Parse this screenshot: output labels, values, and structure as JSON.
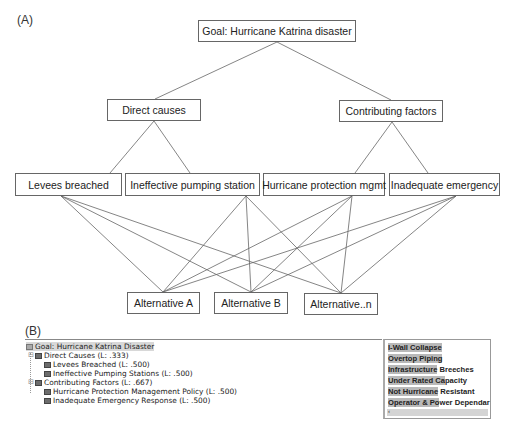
{
  "section_a": {
    "label": "(A)",
    "goal": "Goal: Hurricane Katrina disaster",
    "criteria": [
      "Direct causes",
      "Contributing factors"
    ],
    "subcriteria": [
      "Levees breached",
      "Ineffective pumping station",
      "Hurricane protection mgmt",
      "Inadequate emergency"
    ],
    "alternatives": [
      "Alternative A",
      "Alternative B",
      "Alternative..n"
    ]
  },
  "section_b": {
    "label": "(B)",
    "tree": {
      "goal": "Goal: Hurricane Katrina Disaster",
      "items": [
        {
          "label": "Direct Causes (L: .333)",
          "level": 1,
          "expander": "⊟"
        },
        {
          "label": "Levees Breached (L: .500)",
          "level": 2
        },
        {
          "label": "Ineffective Pumping Stations (L: .500)",
          "level": 2
        },
        {
          "label": "Contributing Factors (L: .667)",
          "level": 1,
          "expander": "⊟"
        },
        {
          "label": "Hurricane Protection Management Policy (L: .500)",
          "level": 2
        },
        {
          "label": "Inadequate Emergency Response (L: .500)",
          "level": 2
        }
      ]
    },
    "panel": {
      "items": [
        {
          "highlight": "I-Wall Collapse",
          "rest": ""
        },
        {
          "highlight": "Overtop Piping",
          "rest": ""
        },
        {
          "highlight": "Infrastructure",
          "rest": " Breeches"
        },
        {
          "highlight": "Under Rated Ca",
          "rest": "pacity"
        },
        {
          "highlight": "Not Hurricane",
          "rest": " Resistant"
        },
        {
          "highlight": "Operator & Po",
          "rest": "wer Dependar"
        }
      ],
      "scroll_arrow": "‹"
    }
  }
}
